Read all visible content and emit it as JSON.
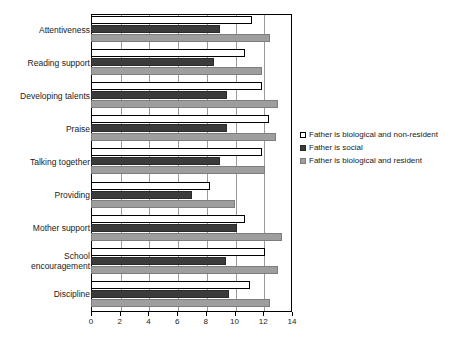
{
  "chart_data": {
    "type": "bar",
    "orientation": "horizontal",
    "title": "",
    "subtitle": "",
    "xlabel": "",
    "ylabel": "",
    "xlim": [
      0,
      14
    ],
    "xticks": [
      0,
      2,
      4,
      6,
      8,
      10,
      12,
      14
    ],
    "xtick_labels": [
      "0",
      "2",
      "4",
      "6",
      "8",
      "10",
      "12",
      "14"
    ],
    "grid": true,
    "grid_axis": "x",
    "legend_position": "right",
    "categories": [
      "Attentiveness",
      "Reading support",
      "Developing talents",
      "Praise",
      "Talking together",
      "Providing",
      "Mother support",
      "School encouragement",
      "Discipline"
    ],
    "series": [
      {
        "name": "Father is biological and non-resident",
        "color": "#ffffff",
        "values": [
          11.2,
          10.7,
          11.9,
          12.4,
          11.9,
          8.3,
          10.7,
          12.1,
          11.1
        ]
      },
      {
        "name": "Father is social",
        "color": "#3b3b3b",
        "values": [
          9.0,
          8.6,
          9.5,
          9.5,
          9.0,
          7.0,
          10.2,
          9.4,
          9.6
        ]
      },
      {
        "name": "Father is biological and resident",
        "color": "#9e9e9e",
        "values": [
          12.5,
          11.9,
          13.0,
          12.9,
          12.1,
          10.0,
          13.3,
          13.0,
          12.5
        ]
      }
    ]
  }
}
